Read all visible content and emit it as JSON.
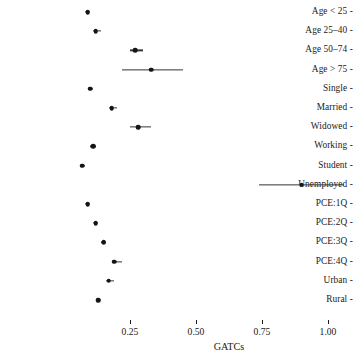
{
  "chart_data": {
    "type": "scatter",
    "plot_style": "forest-plot",
    "title": "",
    "subtitle": "",
    "xlabel": "GATCs",
    "ylabel": "",
    "xlim": [
      0.05,
      1.09
    ],
    "xticks": [
      0.25,
      0.5,
      0.75,
      1.0
    ],
    "xticklabels": [
      "0.25",
      "0.50",
      "0.75",
      "1.00"
    ],
    "grid": false,
    "legend": null,
    "orientation": "horizontal",
    "categories": [
      "Age < 25",
      "Age 25–40",
      "Age 50–74",
      "Age > 75",
      "Single",
      "Married",
      "Widowed",
      "Working",
      "Student",
      "Unemployed",
      "PCE:1Q",
      "PCE:2Q",
      "PCE:3Q",
      "PCE:4Q",
      "Urban",
      "Rural"
    ],
    "values": [
      0.09,
      0.12,
      0.27,
      0.33,
      0.1,
      0.18,
      0.28,
      0.11,
      0.07,
      0.9,
      0.09,
      0.12,
      0.15,
      0.19,
      0.17,
      0.13
    ],
    "ci_low": [
      0.08,
      0.11,
      0.25,
      0.22,
      0.09,
      0.17,
      0.25,
      0.1,
      0.06,
      0.74,
      0.08,
      0.11,
      0.14,
      0.18,
      0.16,
      0.12
    ],
    "ci_high": [
      0.1,
      0.14,
      0.3,
      0.45,
      0.11,
      0.2,
      0.33,
      0.12,
      0.08,
      1.06,
      0.1,
      0.13,
      0.16,
      0.22,
      0.19,
      0.14
    ],
    "points": [
      {
        "label": "Age < 25",
        "estimate": 0.09,
        "ci_low": 0.08,
        "ci_high": 0.1
      },
      {
        "label": "Age 25–40",
        "estimate": 0.12,
        "ci_low": 0.11,
        "ci_high": 0.14
      },
      {
        "label": "Age 50–74",
        "estimate": 0.27,
        "ci_low": 0.25,
        "ci_high": 0.3
      },
      {
        "label": "Age > 75",
        "estimate": 0.33,
        "ci_low": 0.22,
        "ci_high": 0.45
      },
      {
        "label": "Single",
        "estimate": 0.1,
        "ci_low": 0.09,
        "ci_high": 0.11
      },
      {
        "label": "Married",
        "estimate": 0.18,
        "ci_low": 0.17,
        "ci_high": 0.2
      },
      {
        "label": "Widowed",
        "estimate": 0.28,
        "ci_low": 0.25,
        "ci_high": 0.33
      },
      {
        "label": "Working",
        "estimate": 0.11,
        "ci_low": 0.1,
        "ci_high": 0.12
      },
      {
        "label": "Student",
        "estimate": 0.07,
        "ci_low": 0.06,
        "ci_high": 0.08
      },
      {
        "label": "Unemployed",
        "estimate": 0.9,
        "ci_low": 0.74,
        "ci_high": 1.06
      },
      {
        "label": "PCE:1Q",
        "estimate": 0.09,
        "ci_low": 0.08,
        "ci_high": 0.1
      },
      {
        "label": "PCE:2Q",
        "estimate": 0.12,
        "ci_low": 0.11,
        "ci_high": 0.13
      },
      {
        "label": "PCE:3Q",
        "estimate": 0.15,
        "ci_low": 0.14,
        "ci_high": 0.16
      },
      {
        "label": "PCE:4Q",
        "estimate": 0.19,
        "ci_low": 0.18,
        "ci_high": 0.22
      },
      {
        "label": "Urban",
        "estimate": 0.17,
        "ci_low": 0.16,
        "ci_high": 0.19
      },
      {
        "label": "Rural",
        "estimate": 0.13,
        "ci_low": 0.12,
        "ci_high": 0.14
      }
    ],
    "marker": {
      "shape": "circle",
      "color": "#151515",
      "size": 4.6
    },
    "ci_line": {
      "color": "#333333",
      "width": 1.25
    },
    "tick_dash": "-"
  },
  "layout": {
    "label_column_right": 104,
    "plot_left": 110,
    "plot_right": 351,
    "first_row_y": 12,
    "row_spacing": 19.2,
    "axis_y": 320,
    "tick_label_y": 327,
    "axis_title_y": 342,
    "x_zero_px": 64,
    "px_per_unit": 264
  }
}
